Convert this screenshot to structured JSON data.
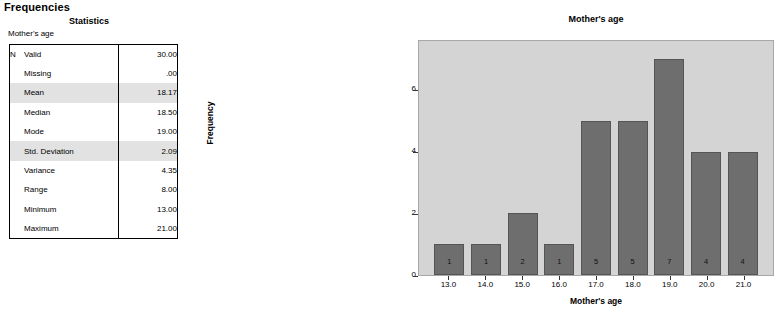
{
  "output": {
    "heading": "Frequencies",
    "table_title": "Statistics",
    "variable_caption": "Mother's age",
    "n_label": "N",
    "rows": [
      {
        "label": "Valid",
        "value": "30.00",
        "highlight": false,
        "show_n": true
      },
      {
        "label": "Missing",
        "value": ".00",
        "highlight": false,
        "show_n": false
      },
      {
        "label": "Mean",
        "value": "18.17",
        "highlight": true,
        "show_n": false
      },
      {
        "label": "Median",
        "value": "18.50",
        "highlight": false,
        "show_n": false
      },
      {
        "label": "Mode",
        "value": "19.00",
        "highlight": false,
        "show_n": false
      },
      {
        "label": "Std. Deviation",
        "value": "2.09",
        "highlight": true,
        "show_n": false
      },
      {
        "label": "Variance",
        "value": "4.35",
        "highlight": false,
        "show_n": false
      },
      {
        "label": "Range",
        "value": "8.00",
        "highlight": false,
        "show_n": false
      },
      {
        "label": "Minimum",
        "value": "13.00",
        "highlight": false,
        "show_n": false
      },
      {
        "label": "Maximum",
        "value": "21.00",
        "highlight": false,
        "show_n": false
      }
    ]
  },
  "chart_data": {
    "type": "bar",
    "title": "Mother's age",
    "xlabel": "Mother's age",
    "ylabel": "Frequency",
    "categories": [
      "13.0",
      "14.0",
      "15.0",
      "16.0",
      "17.0",
      "18.0",
      "19.0",
      "20.0",
      "21.0"
    ],
    "values": [
      1,
      1,
      2,
      1,
      5,
      5,
      7,
      4,
      4
    ],
    "bar_labels": [
      "1",
      "1",
      "2",
      "1",
      "5",
      "5",
      "7",
      "4",
      "4"
    ],
    "ylim": [
      0,
      7.6
    ],
    "yticks": [
      0,
      2,
      4,
      6
    ],
    "ytick_labels": [
      "0",
      "2",
      "4",
      "6"
    ],
    "grid": false,
    "legend": "none",
    "colors": {
      "bar_fill": "#6e6e6e",
      "bar_border": "#555555",
      "plot_background": "#d4d4d4",
      "plot_border": "#a8a8a8"
    }
  }
}
